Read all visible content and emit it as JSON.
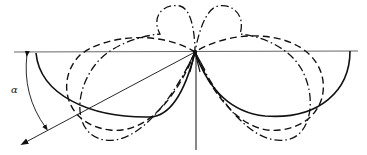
{
  "diagram": {
    "type": "polar-lobe-diagram",
    "angle_label": "α",
    "colors": {
      "stroke": "#111111",
      "baseline": "#444444",
      "background": "#ffffff"
    },
    "lobes": [
      {
        "name": "solid-lobe",
        "style": "solid"
      },
      {
        "name": "dashed-lobe",
        "style": "dashed"
      },
      {
        "name": "dash-dot-lobe",
        "style": "dash-dot"
      }
    ]
  }
}
